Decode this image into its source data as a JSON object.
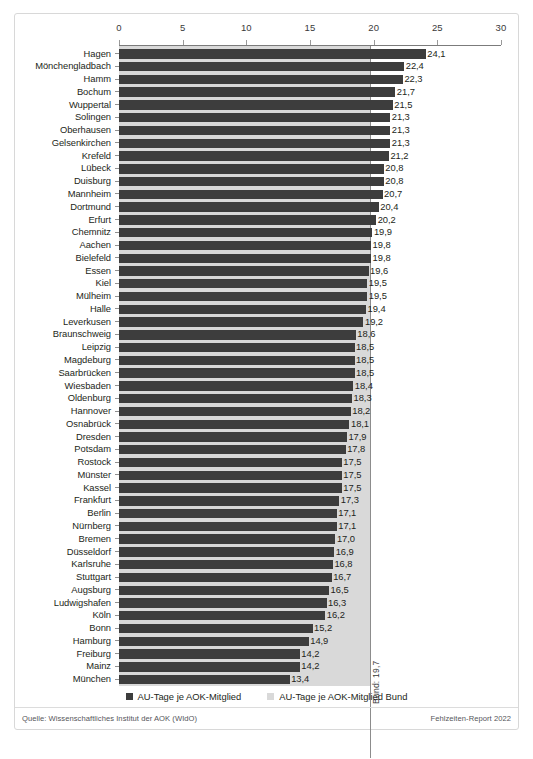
{
  "chart_data": {
    "type": "bar",
    "orientation": "horizontal",
    "title": "",
    "xlabel": "",
    "ylabel": "",
    "xlim": [
      0,
      30
    ],
    "xticks": [
      0,
      5,
      10,
      15,
      20,
      25,
      30
    ],
    "grid": false,
    "legend_position": "bottom-center",
    "categories": [
      "Hagen",
      "Mönchengladbach",
      "Hamm",
      "Bochum",
      "Wuppertal",
      "Solingen",
      "Oberhausen",
      "Gelsenkirchen",
      "Krefeld",
      "Lübeck",
      "Duisburg",
      "Mannheim",
      "Dortmund",
      "Erfurt",
      "Chemnitz",
      "Aachen",
      "Bielefeld",
      "Essen",
      "Kiel",
      "Mülheim",
      "Halle",
      "Leverkusen",
      "Braunschweig",
      "Leipzig",
      "Magdeburg",
      "Saarbrücken",
      "Wiesbaden",
      "Oldenburg",
      "Hannover",
      "Osnabrück",
      "Dresden",
      "Potsdam",
      "Rostock",
      "Münster",
      "Kassel",
      "Frankfurt",
      "Berlin",
      "Nürnberg",
      "Bremen",
      "Düsseldorf",
      "Karlsruhe",
      "Stuttgart",
      "Augsburg",
      "Ludwigshafen",
      "Köln",
      "Bonn",
      "Hamburg",
      "Freiburg",
      "Mainz",
      "München"
    ],
    "values": [
      24.1,
      22.4,
      22.3,
      21.7,
      21.5,
      21.3,
      21.3,
      21.3,
      21.2,
      20.8,
      20.8,
      20.7,
      20.4,
      20.2,
      19.9,
      19.8,
      19.8,
      19.6,
      19.5,
      19.5,
      19.4,
      19.2,
      18.6,
      18.5,
      18.5,
      18.5,
      18.4,
      18.3,
      18.2,
      18.1,
      17.9,
      17.8,
      17.5,
      17.5,
      17.5,
      17.3,
      17.1,
      17.1,
      17.0,
      16.9,
      16.8,
      16.7,
      16.5,
      16.3,
      16.2,
      15.2,
      14.9,
      14.2,
      14.2,
      13.4
    ],
    "value_labels": [
      "24,1",
      "22,4",
      "22,3",
      "21,7",
      "21,5",
      "21,3",
      "21,3",
      "21,3",
      "21,2",
      "20,8",
      "20,8",
      "20,7",
      "20,4",
      "20,2",
      "19,9",
      "19,8",
      "19,8",
      "19,6",
      "19,5",
      "19,5",
      "19,4",
      "19,2",
      "18,6",
      "18,5",
      "18,5",
      "18,5",
      "18,4",
      "18,3",
      "18,2",
      "18,1",
      "17,9",
      "17,8",
      "17,5",
      "17,5",
      "17,5",
      "17,3",
      "17,1",
      "17,1",
      "17,0",
      "16,9",
      "16,8",
      "16,7",
      "16,5",
      "16,3",
      "16,2",
      "15,2",
      "14,9",
      "14,2",
      "14,2",
      "13,4"
    ],
    "reference_line": {
      "label": "Bund: 19,7",
      "value": 19.7,
      "series_name": "AU-Tage je AOK-Mitglied Bund"
    },
    "series": [
      {
        "name": "AU-Tage je AOK-Mitglied",
        "color": "#3d3d3d"
      },
      {
        "name": "AU-Tage je AOK-Mitglied Bund",
        "color": "#d9d9d9"
      }
    ]
  },
  "axis": {
    "tick_labels": [
      "0",
      "5",
      "10",
      "15",
      "20",
      "25",
      "30"
    ]
  },
  "legend": {
    "items": [
      {
        "label": "AU-Tage je AOK-Mitglied",
        "swatch": "dark"
      },
      {
        "label": "AU-Tage je AOK-Mitglied Bund",
        "swatch": "light"
      }
    ]
  },
  "footer": {
    "source": "Quelle: Wissenschaftliches Institut der AOK (WIdO)",
    "report": "Fehlzeiten-Report 2022"
  },
  "caption": {
    "text": ""
  },
  "colors": {
    "bar_dark": "#3d3d3d",
    "band_light": "#d9d9d9",
    "frame": "#d8d8d8",
    "axis": "#7b7b7b"
  }
}
